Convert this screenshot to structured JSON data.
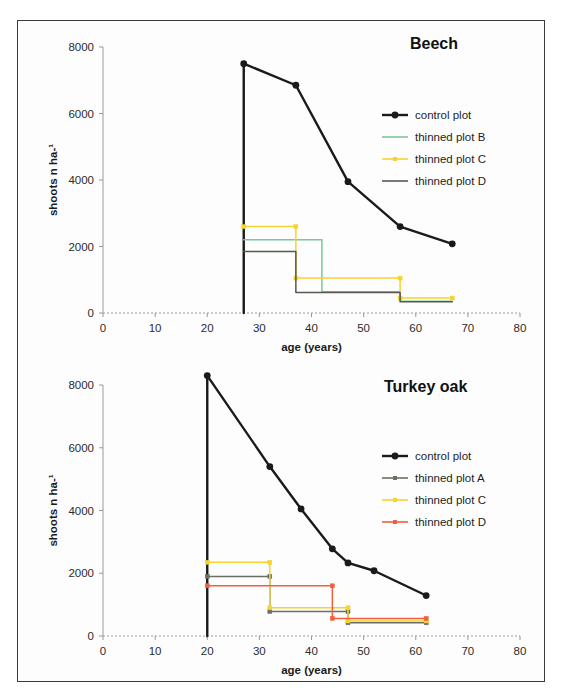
{
  "figure": {
    "axis_x_label": "age (years)",
    "axis_y_label": "shoots n ha-¹",
    "x_ticks": [
      "0",
      "10",
      "20",
      "30",
      "40",
      "50",
      "60",
      "70",
      "80"
    ],
    "y_ticks": [
      "0",
      "2000",
      "4000",
      "6000",
      "8000"
    ],
    "colors": {
      "control": "#1a1a1a",
      "plot_a": "#6e6e66",
      "plot_b": "#7fc49b",
      "plot_c": "#f5d430",
      "plot_d_gray": "#58584f",
      "plot_d_red": "#f0603c",
      "axis": "#9a9a9a",
      "frame": "#3a3a3a"
    }
  },
  "chart_data": [
    {
      "type": "line",
      "title": "Beech",
      "xlabel": "age (years)",
      "ylabel": "shoots n ha-¹",
      "xlim": [
        0,
        80
      ],
      "ylim": [
        0,
        8000
      ],
      "xticks": [
        0,
        10,
        20,
        30,
        40,
        50,
        60,
        70,
        80
      ],
      "yticks": [
        0,
        2000,
        4000,
        6000,
        8000
      ],
      "grid": false,
      "legend_position": "upper-right",
      "series": [
        {
          "name": "control plot",
          "color": "#1a1a1a",
          "style": "line-marker",
          "markers": true,
          "x": [
            27,
            27,
            37,
            47,
            57,
            67
          ],
          "values": [
            0,
            7500,
            6850,
            3950,
            2600,
            2080
          ]
        },
        {
          "name": "thinned plot B",
          "color": "#7fc49b",
          "style": "step",
          "markers": false,
          "x": [
            27,
            42,
            42,
            57,
            57,
            67
          ],
          "values": [
            2200,
            2200,
            640,
            640,
            350,
            350
          ]
        },
        {
          "name": "thinned plot C",
          "color": "#f5d430",
          "style": "step",
          "markers": true,
          "x": [
            27,
            37,
            37,
            57,
            57,
            67
          ],
          "values": [
            2600,
            2600,
            1050,
            1050,
            450,
            450
          ]
        },
        {
          "name": "thinned plot D",
          "color": "#58584f",
          "style": "step",
          "markers": false,
          "x": [
            27,
            37,
            37,
            57,
            57,
            67
          ],
          "values": [
            1850,
            1850,
            620,
            620,
            340,
            340
          ]
        }
      ]
    },
    {
      "type": "line",
      "title": "Turkey oak",
      "xlabel": "age (years)",
      "ylabel": "shoots n ha-¹",
      "xlim": [
        0,
        80
      ],
      "ylim": [
        0,
        8000
      ],
      "xticks": [
        0,
        10,
        20,
        30,
        40,
        50,
        60,
        70,
        80
      ],
      "yticks": [
        0,
        2000,
        4000,
        6000,
        8000
      ],
      "grid": false,
      "legend_position": "upper-right",
      "series": [
        {
          "name": "control plot",
          "color": "#1a1a1a",
          "style": "line-marker",
          "markers": true,
          "x": [
            20,
            20,
            32,
            38,
            44,
            47,
            52,
            62
          ],
          "values": [
            0,
            8300,
            5400,
            4050,
            2780,
            2330,
            2080,
            1290
          ]
        },
        {
          "name": "thinned plot A",
          "color": "#6e6e66",
          "style": "step",
          "markers": true,
          "x": [
            20,
            32,
            32,
            47,
            47,
            62
          ],
          "values": [
            1900,
            1900,
            780,
            780,
            420,
            420
          ]
        },
        {
          "name": "thinned plot C",
          "color": "#f5d430",
          "style": "step",
          "markers": true,
          "x": [
            20,
            32,
            32,
            47,
            47,
            62
          ],
          "values": [
            2350,
            2350,
            900,
            900,
            480,
            480
          ]
        },
        {
          "name": "thinned plot D",
          "color": "#f0603c",
          "style": "step",
          "markers": true,
          "x": [
            20,
            44,
            44,
            62
          ],
          "values": [
            1600,
            1600,
            560,
            560
          ]
        }
      ]
    }
  ]
}
